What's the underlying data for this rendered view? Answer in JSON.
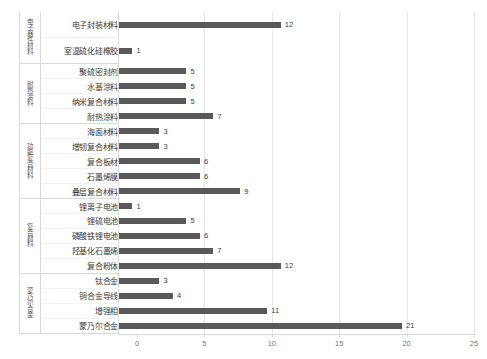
{
  "chart_data": {
    "type": "bar",
    "orientation": "horizontal",
    "title": "",
    "xlabel": "",
    "ylabel": "",
    "xlim": [
      0,
      25
    ],
    "xticks": [
      0,
      5,
      10,
      15,
      20,
      25
    ],
    "grid": "vertical",
    "legend": "none",
    "bar_color": "#595959",
    "grid_color": "#e6e6e6",
    "groups": [
      {
        "group_label": "电子器件材料",
        "categories": [
          "电子封装材料",
          "室温硫化硅橡胶"
        ],
        "values": [
          12,
          1
        ]
      },
      {
        "group_label": "耐热涂料",
        "categories": [
          "聚硫密封剂",
          "水基涂料",
          "纳米复合材料",
          "耐热涂料"
        ],
        "values": [
          5,
          5,
          5,
          7
        ]
      },
      {
        "group_label": "功能复合材料",
        "categories": [
          "海面材料",
          "增韧复合材料",
          "复合板材",
          "石墨烯膜",
          "叠层复合材料"
        ],
        "values": [
          3,
          3,
          6,
          6,
          9
        ]
      },
      {
        "group_label": "复合材料",
        "categories": [
          "锂离子电池",
          "锂硫电池",
          "磷酸铁锂电池",
          "羟基化石墨烯",
          "复合粉体"
        ],
        "values": [
          1,
          5,
          6,
          7,
          12
        ]
      },
      {
        "group_label": "蒙乃尔合金",
        "categories": [
          "钛合金",
          "铜合金导线",
          "增强相",
          "蒙乃尔合金"
        ],
        "values": [
          3,
          4,
          11,
          21
        ]
      }
    ],
    "categories": [
      "电子封装材料",
      "室温硫化硅橡胶",
      "聚硫密封剂",
      "水基涂料",
      "纳米复合材料",
      "耐热涂料",
      "海面材料",
      "增韧复合材料",
      "复合板材",
      "石墨烯膜",
      "叠层复合材料",
      "锂离子电池",
      "锂硫电池",
      "磷酸铁锂电池",
      "羟基化石墨烯",
      "复合粉体",
      "钛合金",
      "铜合金导线",
      "增强相",
      "蒙乃尔合金"
    ],
    "values": [
      12,
      1,
      5,
      5,
      5,
      7,
      3,
      3,
      6,
      6,
      9,
      1,
      5,
      6,
      7,
      12,
      3,
      4,
      11,
      21
    ]
  }
}
